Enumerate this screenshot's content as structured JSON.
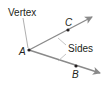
{
  "diagram": {
    "type": "angle",
    "labels": {
      "vertex_caption": "Vertex",
      "sides_caption": "Sides",
      "vertex_point": "A",
      "upper_point": "C",
      "lower_point": "B"
    },
    "colors": {
      "ray": "#8a8a8a",
      "leader": "#9a9a9a",
      "point": "#231f20",
      "text": "#231f20"
    },
    "rays": [
      {
        "name": "ray-AC",
        "from": "A",
        "through": "C"
      },
      {
        "name": "ray-AB",
        "from": "A",
        "through": "B"
      }
    ]
  }
}
